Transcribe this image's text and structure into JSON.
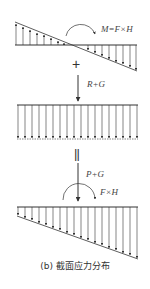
{
  "figure": {
    "caption": "(b) 截面应力分布",
    "panels": [
      {
        "id": "bending",
        "description": "Linear (triangular) stress distribution from moment",
        "moment_label": "M=F×H"
      },
      {
        "id": "axial",
        "description": "Uniform compressive stress distribution",
        "force_label": "R+G"
      },
      {
        "id": "combined",
        "description": "Trapezoidal combined stress distribution",
        "force_label": "P+G",
        "moment_label": "F×H"
      }
    ],
    "operators": {
      "plus": "+",
      "equals": "||"
    },
    "colors": {
      "line": "#333333",
      "text": "#444444",
      "background": "#ffffff"
    }
  }
}
